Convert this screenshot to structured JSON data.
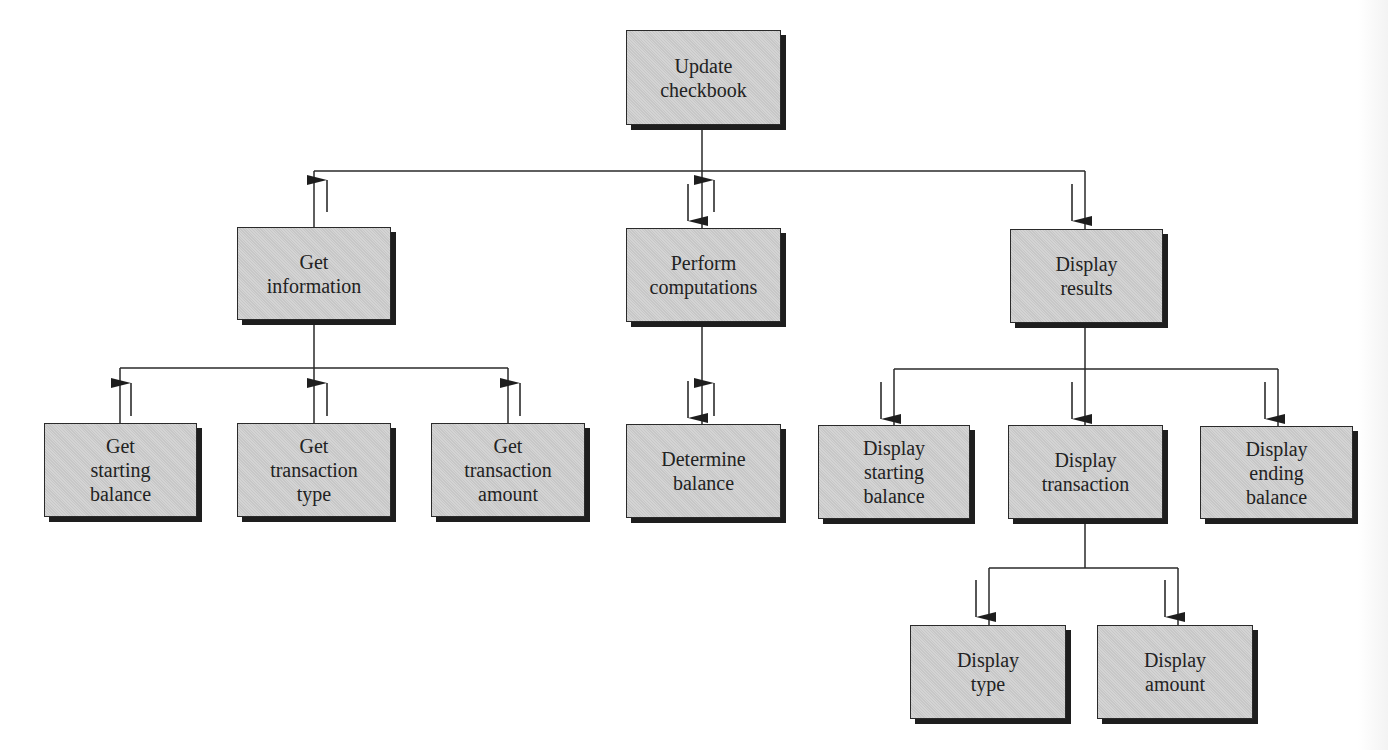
{
  "figure": {
    "type": "structure chart",
    "cutoff_caption": "",
    "colors": {
      "box_fill": "#cfcfcf",
      "box_border": "#2a2a2a",
      "box_shadow": "#1e1e1e",
      "line": "#2a2a2a",
      "text": "#222222"
    }
  },
  "nodes": {
    "root": {
      "label": "Update\ncheckbook"
    },
    "get_information": {
      "label": "Get\ninformation"
    },
    "perform_computations": {
      "label": "Perform\ncomputations"
    },
    "display_results": {
      "label": "Display\nresults"
    },
    "get_starting_balance": {
      "label": "Get\nstarting\nbalance"
    },
    "get_transaction_type": {
      "label": "Get\ntransaction\ntype"
    },
    "get_transaction_amount": {
      "label": "Get\ntransaction\namount"
    },
    "determine_balance": {
      "label": "Determine\nbalance"
    },
    "display_starting_balance": {
      "label": "Display\nstarting\nbalance"
    },
    "display_transaction": {
      "label": "Display\ntransaction"
    },
    "display_ending_balance": {
      "label": "Display\nending\nbalance"
    },
    "display_type": {
      "label": "Display\ntype"
    },
    "display_amount": {
      "label": "Display\namount"
    }
  },
  "edges": [
    {
      "from": "root",
      "to": "get_information",
      "data_flow": [
        "up"
      ]
    },
    {
      "from": "root",
      "to": "perform_computations",
      "data_flow": [
        "down",
        "up"
      ]
    },
    {
      "from": "root",
      "to": "display_results",
      "data_flow": [
        "down"
      ]
    },
    {
      "from": "get_information",
      "to": "get_starting_balance",
      "data_flow": [
        "up"
      ]
    },
    {
      "from": "get_information",
      "to": "get_transaction_type",
      "data_flow": [
        "up"
      ]
    },
    {
      "from": "get_information",
      "to": "get_transaction_amount",
      "data_flow": [
        "up"
      ]
    },
    {
      "from": "perform_computations",
      "to": "determine_balance",
      "data_flow": [
        "down",
        "up"
      ]
    },
    {
      "from": "display_results",
      "to": "display_starting_balance",
      "data_flow": [
        "down"
      ]
    },
    {
      "from": "display_results",
      "to": "display_transaction",
      "data_flow": [
        "down"
      ]
    },
    {
      "from": "display_results",
      "to": "display_ending_balance",
      "data_flow": [
        "down"
      ]
    },
    {
      "from": "display_transaction",
      "to": "display_type",
      "data_flow": [
        "down"
      ]
    },
    {
      "from": "display_transaction",
      "to": "display_amount",
      "data_flow": [
        "down"
      ]
    }
  ]
}
